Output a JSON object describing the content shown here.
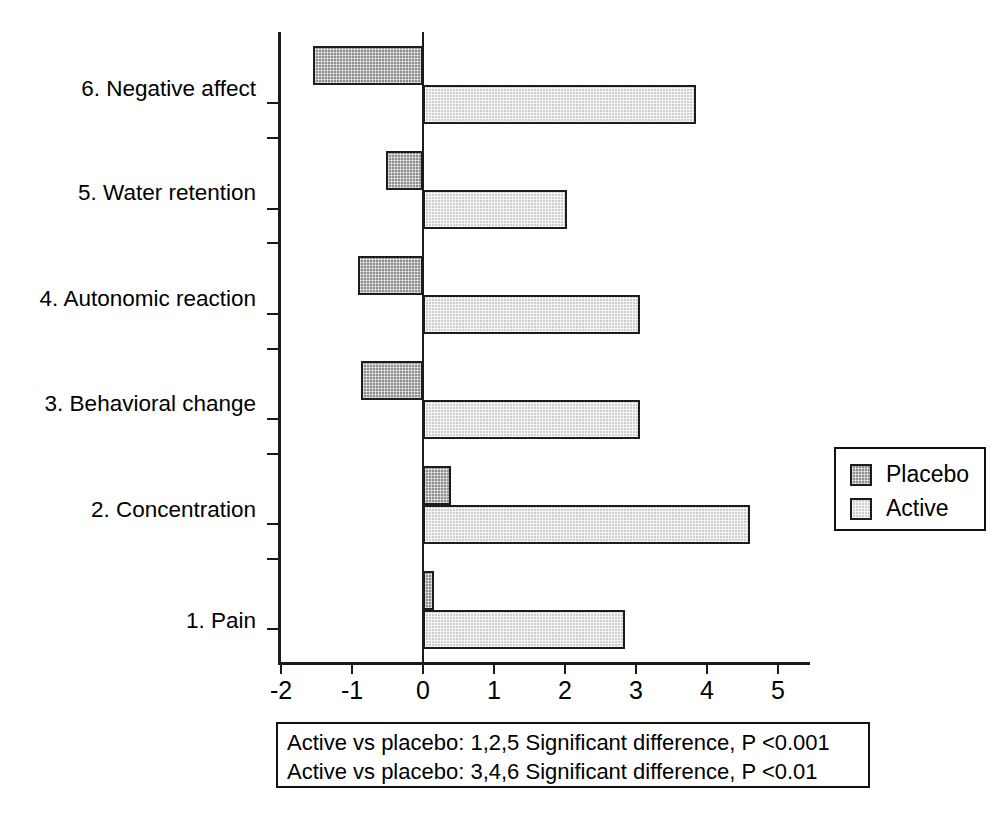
{
  "chart_data": {
    "type": "bar",
    "orientation": "horizontal",
    "title": "",
    "xlabel": "",
    "ylabel": "",
    "xlim": [
      -2,
      5
    ],
    "grid": false,
    "legend_position": "right",
    "categories": [
      "1. Pain",
      "2. Concentration",
      "3. Behavioral change",
      "4. Autonomic reaction",
      "5. Water retention",
      "6. Negative affect"
    ],
    "series": [
      {
        "name": "Placebo",
        "values": [
          0.15,
          0.4,
          -0.87,
          -0.92,
          -0.52,
          -1.55
        ]
      },
      {
        "name": "Active",
        "values": [
          2.85,
          4.6,
          3.05,
          3.05,
          2.03,
          3.85
        ]
      }
    ],
    "xticks": [
      -2,
      -1,
      0,
      1,
      2,
      3,
      4,
      5
    ],
    "xtick_labels": [
      "-2",
      "-1",
      "0",
      "1",
      "2",
      "3",
      "4",
      "5"
    ],
    "annotations": [
      "Active vs placebo: 1,2,5 Significant difference, P <0.001",
      "Active vs placebo: 3,4,6 Significant difference, P <0.01"
    ],
    "colors": {
      "placebo_fill": "#8f8f8f",
      "active_fill": "#cfcfcf",
      "outline": "#1c1c1c",
      "axis": "#1a1a1a",
      "background": "#ffffff"
    }
  },
  "legend": {
    "items": [
      {
        "label": "Placebo"
      },
      {
        "label": "Active"
      }
    ]
  },
  "axis": {
    "tick_labels": [
      "-2",
      "-1",
      "0",
      "1",
      "2",
      "3",
      "4",
      "5"
    ]
  },
  "categories": {
    "c0": "1. Pain",
    "c1": "2. Concentration",
    "c2": "3. Behavioral change",
    "c3": "4. Autonomic reaction",
    "c4": "5. Water retention",
    "c5": "6. Negative affect"
  },
  "annotation": {
    "line1": "Active vs placebo: 1,2,5 Significant difference, P <0.001",
    "line2": "Active vs placebo: 3,4,6 Significant difference, P <0.01"
  }
}
